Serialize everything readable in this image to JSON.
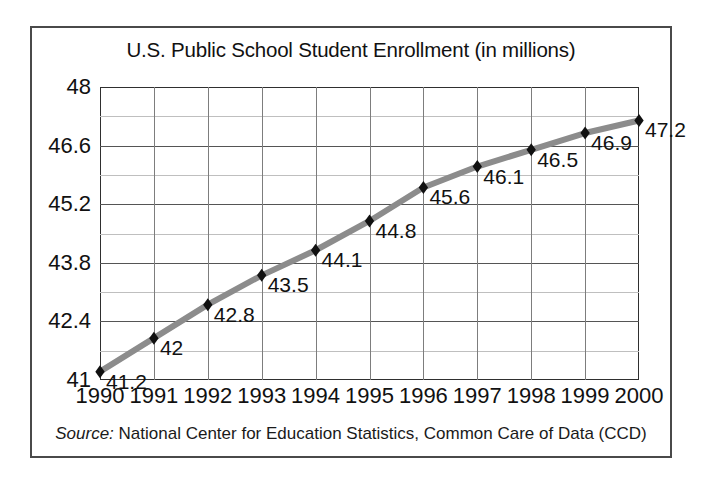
{
  "chart_data": {
    "type": "line",
    "title": "U.S. Public School Student Enrollment (in millions)",
    "xlabel": "",
    "ylabel": "",
    "categories": [
      "1990",
      "1991",
      "1992",
      "1993",
      "1994",
      "1995",
      "1996",
      "1997",
      "1998",
      "1999",
      "2000"
    ],
    "values": [
      41.2,
      42,
      42.8,
      43.5,
      44.1,
      44.8,
      45.6,
      46.1,
      46.5,
      46.9,
      47.2
    ],
    "point_labels": [
      "41.2",
      "42",
      "42.8",
      "43.5",
      "44.1",
      "44.8",
      "45.6",
      "46.1",
      "46.5",
      "46.9",
      "47.2"
    ],
    "ylim": [
      41,
      48
    ],
    "xlim": [
      "1990",
      "2000"
    ],
    "y_major_ticks": [
      41,
      42.4,
      43.8,
      45.2,
      46.6,
      48
    ],
    "y_major_tick_labels": [
      "41",
      "42.4",
      "43.8",
      "45.2",
      "46.6",
      "48"
    ],
    "y_minor_ticks": [
      41.7,
      43.1,
      44.5,
      45.9,
      47.3
    ],
    "grid": true,
    "legend": "none",
    "series_color": "#8c8c8c",
    "marker_color": "#111111",
    "marker_shape": "diamond",
    "annotations": []
  },
  "source": {
    "label": "Source:",
    "text": "National Center for Education Statistics, Common Care of Data (CCD)"
  },
  "colors": {
    "frame": "#4a4a4a",
    "plot_border": "#2f2f2f",
    "grid_major": "#555555",
    "grid_minor": "#bfbfbf",
    "grid_vertical": "#7d7d7d",
    "line": "#8c8c8c",
    "marker": "#111111",
    "text": "#111111",
    "background": "#ffffff"
  }
}
